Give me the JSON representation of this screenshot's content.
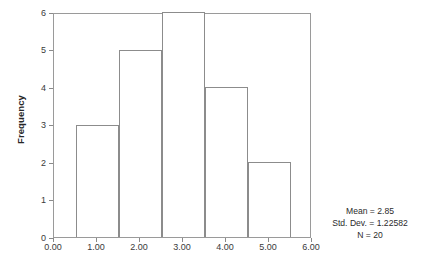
{
  "figure": {
    "type": "spss-histogram",
    "background_color": "#ffffff",
    "frame_color": "#9a9a9a",
    "bar_outline_color": "#8c8c8c",
    "bar_fill_color": "#ffffff",
    "text_color": "#3a3a3a"
  },
  "chart_data": {
    "type": "bar",
    "title": "",
    "xlabel": "",
    "ylabel": "Frequency",
    "categories": [
      "0.50-1.50",
      "1.50-2.50",
      "2.50-3.50",
      "3.50-4.50",
      "4.50-5.50"
    ],
    "bin_edges": [
      0.5,
      1.5,
      2.5,
      3.5,
      4.5,
      5.5
    ],
    "values": [
      3,
      5,
      6,
      4,
      2
    ],
    "bin_width": 1.0,
    "xlim": [
      0.0,
      6.0
    ],
    "ylim": [
      0,
      6
    ],
    "xticks": [
      0.0,
      1.0,
      2.0,
      3.0,
      4.0,
      5.0,
      6.0
    ],
    "xtick_labels": [
      "0.00",
      "1.00",
      "2.00",
      "3.00",
      "4.00",
      "5.00",
      "6.00"
    ],
    "yticks": [
      0,
      1,
      2,
      3,
      4,
      5,
      6
    ],
    "ytick_labels": [
      "0",
      "1",
      "2",
      "3",
      "4",
      "5",
      "6"
    ],
    "grid": false,
    "legend": "none"
  },
  "axes": {
    "y_title": "Frequency"
  },
  "stats": {
    "mean": "Mean = 2.85",
    "std_dev": "Std. Dev. = 1.22582",
    "n": "N = 20"
  }
}
